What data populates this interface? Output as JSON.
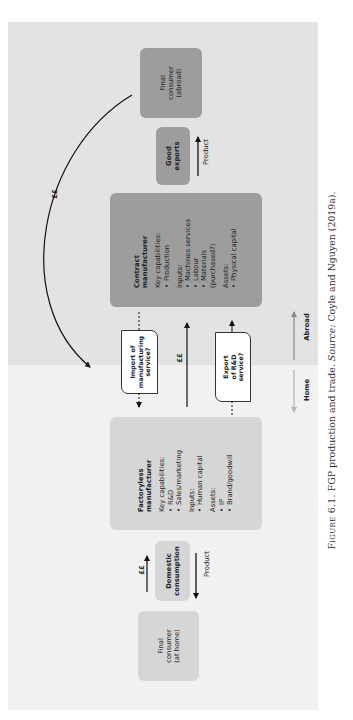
{
  "regions": {
    "abroad_label": "Abroad",
    "home_label": "Home"
  },
  "final_consumer_abroad": {
    "lines": [
      "Final",
      "consumer",
      "(abroad)"
    ]
  },
  "good_exports": {
    "label": "Good exports",
    "flow_label": "Product"
  },
  "contract_manufacturer": {
    "title": "Contract manufacturer",
    "key_capabilities_label": "Key capabilities:",
    "key_capabilities": [
      "Production"
    ],
    "inputs_label": "Inputs:",
    "inputs": [
      "Machines services",
      "Labour",
      "Materials (purchased?)"
    ],
    "assets_label": "Assets:",
    "assets": [
      "Physical capital"
    ]
  },
  "payment_arc": {
    "label": "££"
  },
  "import_service": {
    "lines": [
      "Import of",
      "manufacturing",
      "service?"
    ]
  },
  "payment_middle": {
    "label": "££"
  },
  "export_service": {
    "lines": [
      "Export of R&D",
      "service?"
    ]
  },
  "factoryless_manufacturer": {
    "title": "Factoryless manufacturer",
    "key_capabilities_label": "Key capabilities:",
    "key_capabilities": [
      "R&D",
      "Sales/marketing"
    ],
    "inputs_label": "Inputs:",
    "inputs": [
      "Human capital"
    ],
    "assets_label": "Assets:",
    "assets": [
      "IP",
      "Brand/goodwill"
    ]
  },
  "domestic_consumption": {
    "lines": [
      "Domestic",
      "consumption"
    ],
    "payment_label": "££",
    "flow_label": "Product"
  },
  "final_consumer_home": {
    "lines": [
      "Final",
      "consumer",
      "(at home)"
    ]
  },
  "caption": {
    "figure_label": "Figure 6.1.",
    "title": "FGP production and trade.",
    "source_label": "Source:",
    "source_text": "Coyle and Nguyen (2019a)."
  },
  "colors": {
    "abroad_bg": "#e3e3e3",
    "home_bg": "#f1f1f1",
    "dark_box": "#9d9d9d",
    "light_box": "#d6d6d6",
    "abroad_arrow": "#8a8a8a",
    "home_arrow": "#b5b5b5"
  }
}
